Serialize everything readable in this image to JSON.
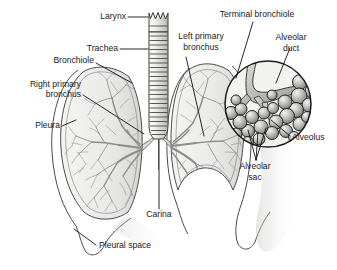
{
  "figure": {
    "background_color": "#ffffff",
    "label_color": "#1a1a1a",
    "leader_color": "#111111",
    "lung_fill_color": "#e9e9e7",
    "bronchial_tree_color": "#8d8d8a",
    "outline_color": "#4a4a4a",
    "shadow_color": "#cfcfcc"
  },
  "labels": {
    "larynx": "Larynx",
    "trachea": "Trachea",
    "bronchiole": "Bronchiole",
    "right_primary_bronchus_line1": "Right primary",
    "right_primary_bronchus_line2": "bronchus",
    "pleura": "Pleura",
    "pleural_space": "Pleural space",
    "carina": "Carina",
    "left_primary_bronchus_line1": "Left primary",
    "left_primary_bronchus_line2": "bronchus",
    "terminal_bronchiole": "Terminal bronchiole",
    "alveolar_duct_line1": "Alveolar",
    "alveolar_duct_line2": "duct",
    "alveolus": "Alveolus",
    "alveolar_sac_line1": "Alveolar",
    "alveolar_sac_line2": "sac"
  },
  "structures": {
    "larynx": "larynx",
    "trachea": "trachea-with-cartilage-rings",
    "right_lung": "right-lung",
    "left_lung": "left-lung",
    "carina": "carina-bifurcation",
    "pleural_membrane": "pleura",
    "pleural_space": "pleural-space",
    "alveolar_inset": "alveolar-cluster-magnification"
  }
}
